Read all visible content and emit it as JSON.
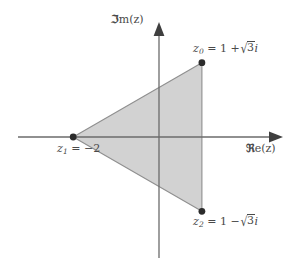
{
  "figure": {
    "name": "complex-plane-triangle",
    "background_color": "#ffffff",
    "axis_color": "#6b6b6b",
    "fill_color": "#d2d2d2",
    "edge_color": "#8a8a8a",
    "text_color": "#4a4a4a",
    "point_color": "#2b2b2b"
  },
  "axes": {
    "real_label_prefix": "ℜ",
    "real_label_suffix": "e(",
    "real_label_var": "z",
    "real_label_close": ")",
    "real_label_full": "ℜe(z)",
    "imag_label_prefix": "ℑ",
    "imag_label_suffix": "m(",
    "imag_label_var": "z",
    "imag_label_close": ")",
    "imag_label_full": "ℑm(z)",
    "x_axis_y": 137,
    "y_axis_x": 159,
    "x_axis_start": 18,
    "x_axis_end": 283,
    "y_axis_top": 22,
    "y_axis_bottom": 258
  },
  "points": [
    {
      "id": "z0",
      "var": "z",
      "sub": "0",
      "eq": "=",
      "value_text": "1 + √3i",
      "real_part": "1 +",
      "radicand": "3",
      "imag_unit": "i",
      "full_label": "z₀ = 1 + √3i",
      "px": 202,
      "py": 68
    },
    {
      "id": "z1",
      "var": "z",
      "sub": "1",
      "eq": "=",
      "value_text": "−2",
      "full_label": "z₁ = −2",
      "px": 74,
      "py": 137
    },
    {
      "id": "z2",
      "var": "z",
      "sub": "2",
      "eq": "=",
      "value_text": "1 − √3i",
      "real_part": "1 −",
      "radicand": "3",
      "imag_unit": "i",
      "full_label": "z₂ = 1 − √3i",
      "px": 202,
      "py": 208
    }
  ],
  "chart_data": {
    "type": "scatter",
    "title": "",
    "xlabel": "ℜe(z)",
    "ylabel": "ℑm(z)",
    "grid": false,
    "legend": null,
    "origin_px": [
      159,
      137
    ],
    "units_per_px_x": 0.0233,
    "units_per_px_y": 0.0233,
    "xlim": [
      -3.3,
      2.9
    ],
    "ylim": [
      -2.8,
      2.7
    ],
    "points": [
      {
        "label": "z₀ = 1 + √3i",
        "x": 1,
        "y": 1.732
      },
      {
        "label": "z₁ = −2",
        "x": -2,
        "y": 0
      },
      {
        "label": "z₂ = 1 − √3i",
        "x": 1,
        "y": -1.732
      }
    ],
    "shapes": [
      {
        "type": "polygon",
        "name": "shaded-triangle",
        "vertices": [
          [
            1,
            1.732
          ],
          [
            -2,
            0
          ],
          [
            1,
            -1.732
          ]
        ],
        "fill": "#d2d2d2",
        "stroke": "#8a8a8a"
      }
    ]
  }
}
